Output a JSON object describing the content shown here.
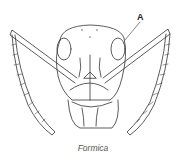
{
  "figure": {
    "caption": "Formica",
    "callout_label": "A",
    "line_color": "#333333"
  }
}
